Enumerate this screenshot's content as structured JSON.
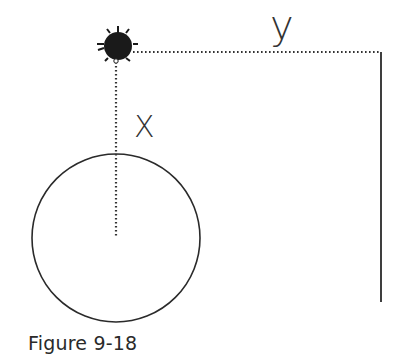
{
  "figure": {
    "caption": "Figure 9-18",
    "labels": {
      "x": "X",
      "y": "y"
    },
    "elements": {
      "mass": {
        "cx": 118,
        "cy": 46,
        "r": 15,
        "color": "#1a1a1a"
      },
      "x_line": {
        "x": 116,
        "y1": 62,
        "y2": 238,
        "style": "dotted"
      },
      "y_line": {
        "y": 52,
        "x1": 133,
        "x2": 381,
        "style": "dotted"
      },
      "wall": {
        "x": 381,
        "y1": 52,
        "y2": 302,
        "style": "solid"
      },
      "circle": {
        "cx": 116,
        "cy": 238,
        "r": 84
      }
    },
    "colors": {
      "ink": "#2a2a2a",
      "background": "#ffffff"
    }
  }
}
